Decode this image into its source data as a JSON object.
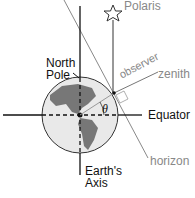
{
  "labels": {
    "polaris": "Polaris",
    "north_pole_1": "North",
    "north_pole_2": "Pole",
    "observer": "observer",
    "zenith": "zenith",
    "equator": "Equator",
    "theta": "θ",
    "horizon": "horizon",
    "axis_1": "Earth's",
    "axis_2": "Axis"
  },
  "colors": {
    "line": "#111111",
    "horizon": "#888888",
    "globe_fill": "#e8e8e8",
    "land": "#777777"
  }
}
